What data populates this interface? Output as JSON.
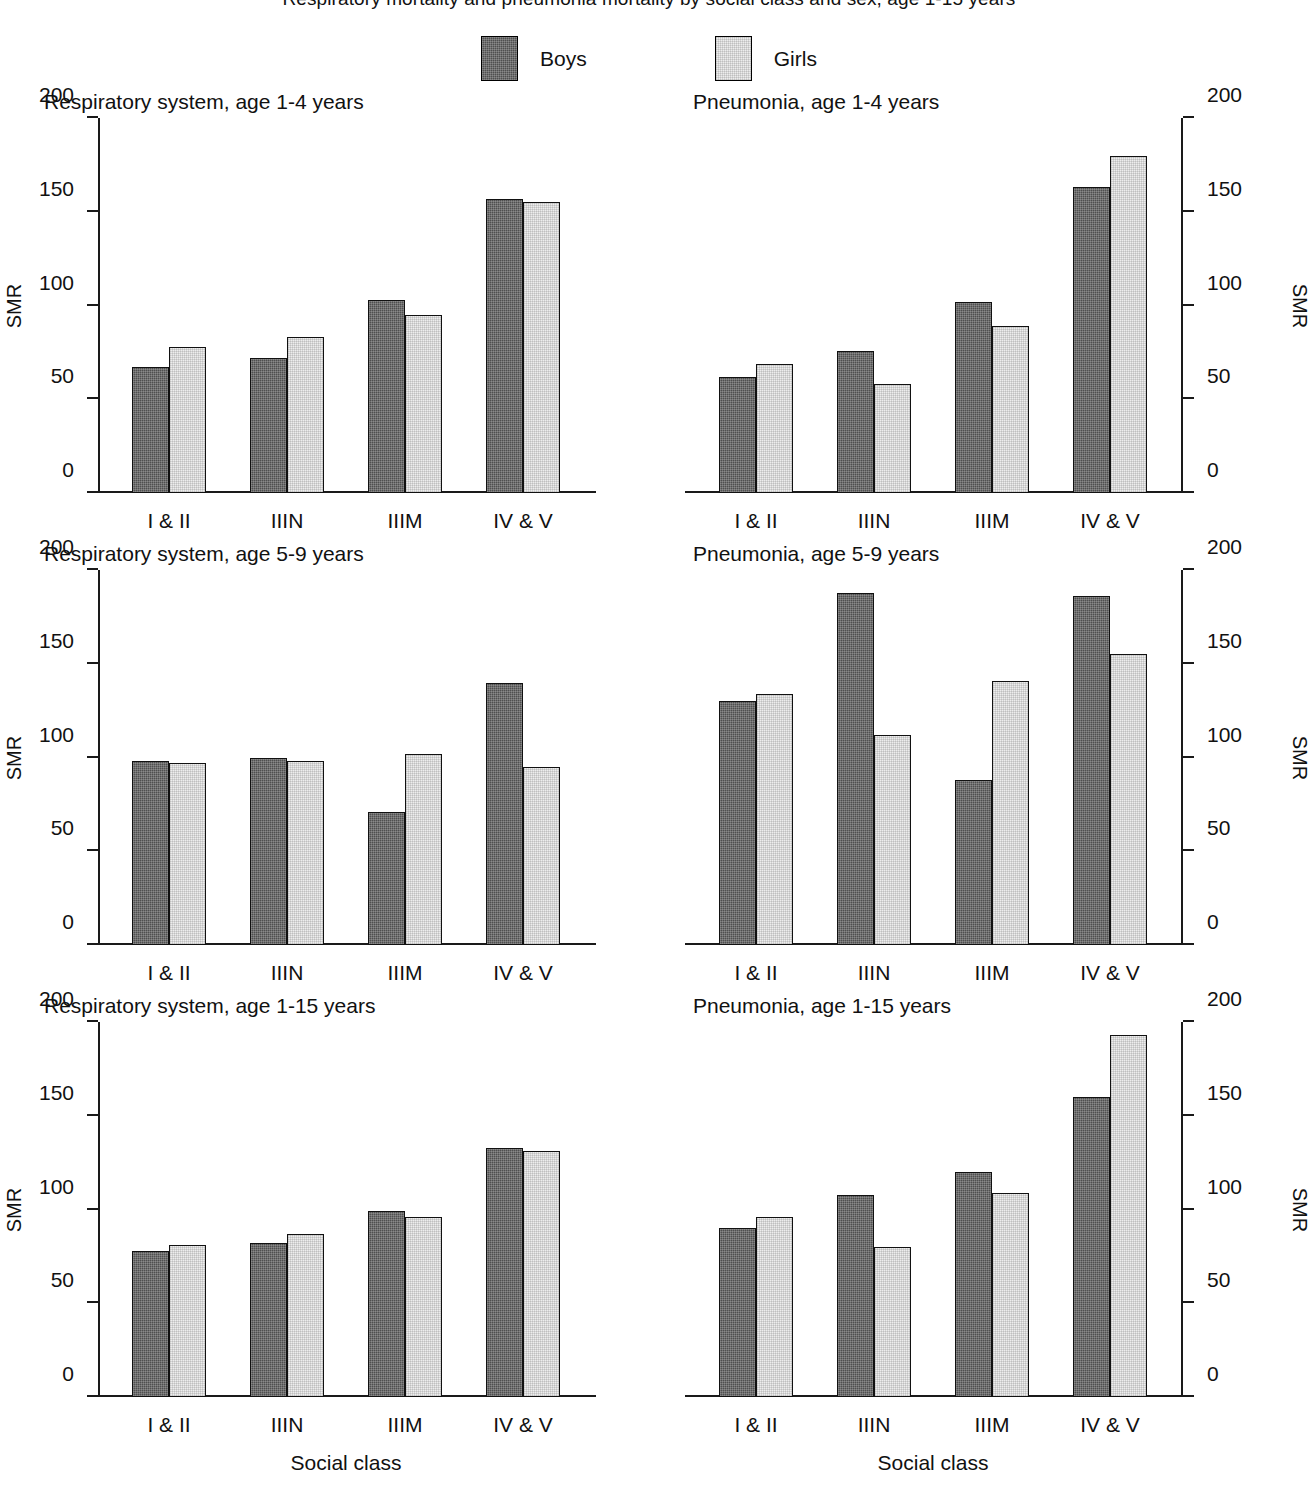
{
  "figure": {
    "title": "Respiratory mortality and pneumonia mortality by social class and sex, age 1-15 years",
    "legend": [
      {
        "key": "boys",
        "label": "Boys",
        "swatch": "dark-hatched-square"
      },
      {
        "key": "girls",
        "label": "Girls",
        "swatch": "light-hatched-square"
      }
    ],
    "colors": {
      "boys": "#4f4f4f",
      "girls": "#ededed",
      "outline": "#111111",
      "axis": "#1a1a1a"
    },
    "axis_title_y": "SMR",
    "axis_title_x": "Social class"
  },
  "chart_data": [
    {
      "type": "bar",
      "title": "Respiratory system, age 1-4 years",
      "xlabel": "",
      "ylabel": "SMR",
      "ylim": [
        0,
        200
      ],
      "yticks": [
        0,
        50,
        100,
        150,
        200
      ],
      "grid": false,
      "legend_position": "top-center",
      "categories": [
        "I & II",
        "IIIN",
        "IIIM",
        "IV & V"
      ],
      "series": [
        {
          "name": "Boys",
          "values": [
            67,
            72,
            103,
            157
          ]
        },
        {
          "name": "Girls",
          "values": [
            78,
            83,
            95,
            155
          ]
        }
      ]
    },
    {
      "type": "bar",
      "title": "Pneumonia, age 1-4 years",
      "xlabel": "",
      "ylabel": "SMR",
      "ylim": [
        0,
        200
      ],
      "yticks": [
        0,
        50,
        100,
        150,
        200
      ],
      "grid": false,
      "legend_position": "top-center",
      "categories": [
        "I & II",
        "IIIN",
        "IIIM",
        "IV & V"
      ],
      "series": [
        {
          "name": "Boys",
          "values": [
            62,
            76,
            102,
            163
          ]
        },
        {
          "name": "Girls",
          "values": [
            69,
            58,
            89,
            180
          ]
        }
      ]
    },
    {
      "type": "bar",
      "title": "Respiratory system, age 5-9 years",
      "xlabel": "",
      "ylabel": "SMR",
      "ylim": [
        0,
        200
      ],
      "yticks": [
        0,
        50,
        100,
        150,
        200
      ],
      "grid": false,
      "legend_position": "top-center",
      "categories": [
        "I & II",
        "IIIN",
        "IIIM",
        "IV & V"
      ],
      "series": [
        {
          "name": "Boys",
          "values": [
            98,
            100,
            71,
            140
          ]
        },
        {
          "name": "Girls",
          "values": [
            97,
            98,
            102,
            95
          ]
        }
      ]
    },
    {
      "type": "bar",
      "title": "Pneumonia, age 5-9 years",
      "xlabel": "",
      "ylabel": "SMR",
      "ylim": [
        0,
        200
      ],
      "yticks": [
        0,
        50,
        100,
        150,
        200
      ],
      "grid": false,
      "legend_position": "top-center",
      "categories": [
        "I & II",
        "IIIN",
        "IIIM",
        "IV & V"
      ],
      "series": [
        {
          "name": "Boys",
          "values": [
            130,
            188,
            88,
            186
          ]
        },
        {
          "name": "Girls",
          "values": [
            134,
            112,
            141,
            155
          ]
        }
      ]
    },
    {
      "type": "bar",
      "title": "Respiratory system, age 1-15 years",
      "xlabel": "Social class",
      "ylabel": "SMR",
      "ylim": [
        0,
        200
      ],
      "yticks": [
        0,
        50,
        100,
        150,
        200
      ],
      "grid": false,
      "legend_position": "top-center",
      "categories": [
        "I & II",
        "IIIN",
        "IIIM",
        "IV & V"
      ],
      "series": [
        {
          "name": "Boys",
          "values": [
            78,
            82,
            99,
            133
          ]
        },
        {
          "name": "Girls",
          "values": [
            81,
            87,
            96,
            131
          ]
        }
      ]
    },
    {
      "type": "bar",
      "title": "Pneumonia, age 1-15 years",
      "xlabel": "Social class",
      "ylabel": "SMR",
      "ylim": [
        0,
        200
      ],
      "yticks": [
        0,
        50,
        100,
        150,
        200
      ],
      "grid": false,
      "legend_position": "top-center",
      "categories": [
        "I & II",
        "IIIN",
        "IIIM",
        "IV & V"
      ],
      "series": [
        {
          "name": "Boys",
          "values": [
            90,
            108,
            120,
            160
          ]
        },
        {
          "name": "Girls",
          "values": [
            96,
            80,
            109,
            193
          ]
        }
      ]
    }
  ]
}
